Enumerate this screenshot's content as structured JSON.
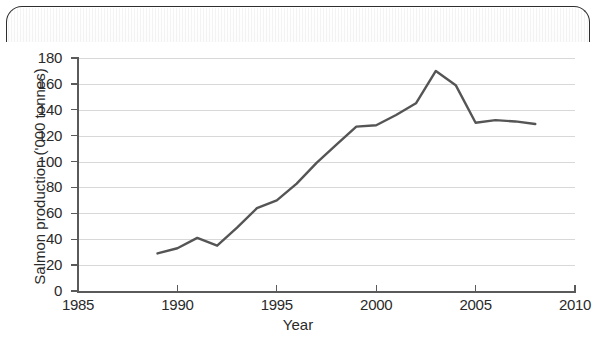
{
  "chart_data": {
    "type": "line",
    "title": "",
    "xlabel": "Year",
    "ylabel": "Salmon production ('000 tonnes)",
    "xlim": [
      1985,
      2010
    ],
    "ylim": [
      0,
      180
    ],
    "xticks": [
      1985,
      1990,
      1995,
      2000,
      2005,
      2010
    ],
    "yticks": [
      0,
      20,
      40,
      60,
      80,
      100,
      120,
      140,
      160,
      180
    ],
    "grid": "horizontal",
    "legend": "none",
    "line_color": "#555555",
    "series": [
      {
        "name": "Salmon production",
        "x": [
          1989,
          1990,
          1991,
          1992,
          1993,
          1994,
          1995,
          1996,
          1997,
          1998,
          1999,
          2000,
          2001,
          2002,
          2003,
          2004,
          2005,
          2006,
          2007,
          2008
        ],
        "values": [
          29,
          33,
          41,
          35,
          49,
          64,
          70,
          83,
          99,
          113,
          127,
          128,
          136,
          145,
          170,
          159,
          130,
          132,
          131,
          129
        ]
      }
    ]
  },
  "axes": {
    "y_tick_labels": [
      "180",
      "160",
      "140",
      "120",
      "100",
      "80",
      "60",
      "40",
      "20",
      "0"
    ],
    "x_tick_labels": [
      "1985",
      "1990",
      "1995",
      "2000",
      "2005",
      "2010"
    ],
    "y_title": "Salmon production ('000 tonnes)",
    "x_title": "Year"
  }
}
